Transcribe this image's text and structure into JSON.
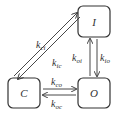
{
  "diagram": {
    "type": "state-transition",
    "states": [
      {
        "id": "C",
        "label": "C"
      },
      {
        "id": "O",
        "label": "O"
      },
      {
        "id": "I",
        "label": "I"
      }
    ],
    "transitions": [
      {
        "from": "C",
        "to": "I",
        "k": "k",
        "sub": "ci"
      },
      {
        "from": "I",
        "to": "C",
        "k": "k",
        "sub": "ic"
      },
      {
        "from": "C",
        "to": "O",
        "k": "k",
        "sub": "co"
      },
      {
        "from": "O",
        "to": "C",
        "k": "k",
        "sub": "oc"
      },
      {
        "from": "O",
        "to": "I",
        "k": "k",
        "sub": "oi"
      },
      {
        "from": "I",
        "to": "O",
        "k": "k",
        "sub": "io"
      }
    ],
    "colors": {
      "stroke": "#333333",
      "background": "#ffffff"
    }
  }
}
